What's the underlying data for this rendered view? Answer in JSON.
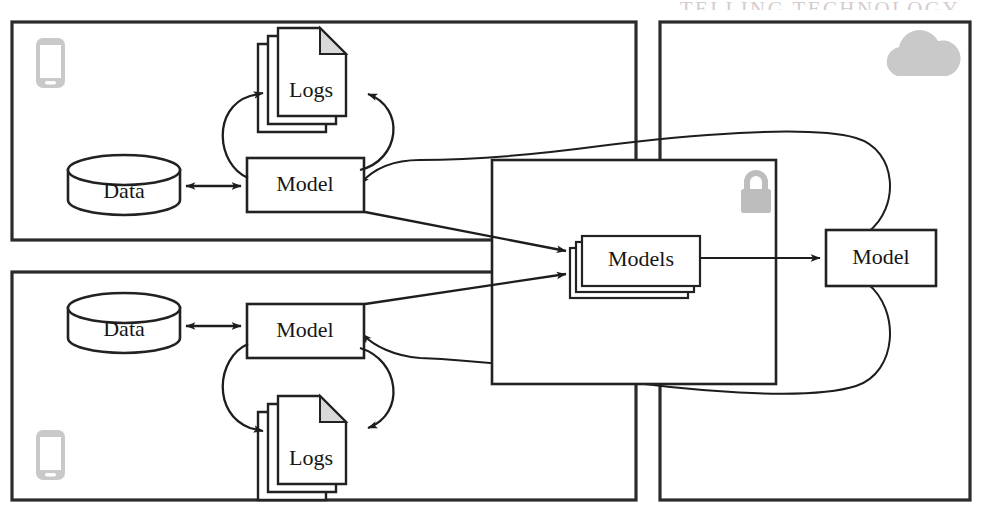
{
  "figure": {
    "title_strip": "TELLING TECHNOLOGY",
    "caption": "",
    "type": "federated-learning-architecture-diagram"
  },
  "colors": {
    "stroke": "#222222",
    "panel_stroke": "#2b2b2b",
    "text": "#161616",
    "icon_gray": "#c9c9c9",
    "fold_gray": "#d9d9d9",
    "background": "#ffffff"
  },
  "panels": [
    {
      "id": "client-top",
      "name": "top-left-client-panel",
      "label": ""
    },
    {
      "id": "client-bottom",
      "name": "bottom-left-client-panel",
      "label": ""
    },
    {
      "id": "cloud",
      "name": "right-cloud-panel",
      "label": ""
    }
  ],
  "nodes": {
    "data_top": {
      "label": "Data",
      "shape": "cylinder"
    },
    "data_bottom": {
      "label": "Data",
      "shape": "cylinder"
    },
    "logs_top": {
      "label": "Logs",
      "shape": "document-stack"
    },
    "logs_bottom": {
      "label": "Logs",
      "shape": "document-stack"
    },
    "model_top": {
      "label": "Model",
      "shape": "rect"
    },
    "model_bottom": {
      "label": "Model",
      "shape": "rect"
    },
    "models_server": {
      "label": "Models",
      "shape": "rect-stack"
    },
    "model_cloud": {
      "label": "Model",
      "shape": "rect"
    }
  },
  "icons": {
    "phone_top": {
      "name": "smartphone-icon",
      "glyph": "phone"
    },
    "phone_bottom": {
      "name": "smartphone-icon",
      "glyph": "phone"
    },
    "cloud": {
      "name": "cloud-icon",
      "glyph": "cloud"
    },
    "lock": {
      "name": "padlock-icon",
      "glyph": "lock"
    }
  },
  "edges": [
    {
      "from": "data_top",
      "to": "model_top",
      "kind": "bidirectional",
      "style": "straight"
    },
    {
      "from": "model_top",
      "to": "logs_top",
      "kind": "directed",
      "style": "curved"
    },
    {
      "from": "data_bottom",
      "to": "model_bottom",
      "kind": "bidirectional",
      "style": "straight"
    },
    {
      "from": "model_bottom",
      "to": "logs_bottom",
      "kind": "directed",
      "style": "curved"
    },
    {
      "from": "model_top",
      "to": "models_server",
      "kind": "directed",
      "style": "straight"
    },
    {
      "from": "model_bottom",
      "to": "models_server",
      "kind": "directed",
      "style": "straight"
    },
    {
      "from": "models_server",
      "to": "model_cloud",
      "kind": "directed",
      "style": "straight"
    },
    {
      "from": "model_cloud",
      "to": "model_top",
      "kind": "directed",
      "style": "loop-curve"
    },
    {
      "from": "model_cloud",
      "to": "model_bottom",
      "kind": "directed",
      "style": "loop-curve"
    }
  ]
}
